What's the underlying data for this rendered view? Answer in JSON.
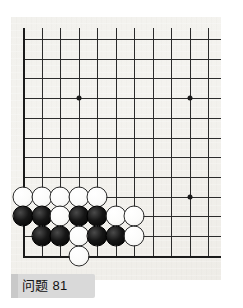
{
  "caption": {
    "label": "问题 81"
  },
  "board": {
    "type": "go-board-diagram",
    "columns": 11,
    "rows": 12,
    "visible_region": "bottom-left corner, right and top edges cropped",
    "colors": {
      "paper": "#f2f1ed",
      "grid_line": "#2b2b2b",
      "edge_line": "#1a1a1a",
      "black_stone": "#000000",
      "white_stone": "#ffffff",
      "caption_tab": "#d9d9d9"
    },
    "star_points": [
      {
        "col": 4,
        "row": 4
      },
      {
        "col": 10,
        "row": 4
      }
    ],
    "marker_stones": [
      {
        "col": 10,
        "row": 9,
        "color": "black-dot"
      }
    ],
    "stones": [
      {
        "col": 1,
        "row": 9,
        "color": "white"
      },
      {
        "col": 2,
        "row": 9,
        "color": "white"
      },
      {
        "col": 3,
        "row": 9,
        "color": "white"
      },
      {
        "col": 4,
        "row": 9,
        "color": "white"
      },
      {
        "col": 5,
        "row": 9,
        "color": "white"
      },
      {
        "col": 1,
        "row": 10,
        "color": "black"
      },
      {
        "col": 2,
        "row": 10,
        "color": "black"
      },
      {
        "col": 3,
        "row": 10,
        "color": "white"
      },
      {
        "col": 4,
        "row": 10,
        "color": "black"
      },
      {
        "col": 5,
        "row": 10,
        "color": "black"
      },
      {
        "col": 6,
        "row": 10,
        "color": "white"
      },
      {
        "col": 7,
        "row": 10,
        "color": "white"
      },
      {
        "col": 2,
        "row": 11,
        "color": "black"
      },
      {
        "col": 3,
        "row": 11,
        "color": "black"
      },
      {
        "col": 4,
        "row": 11,
        "color": "white"
      },
      {
        "col": 5,
        "row": 11,
        "color": "black"
      },
      {
        "col": 6,
        "row": 11,
        "color": "black"
      },
      {
        "col": 7,
        "row": 11,
        "color": "white"
      },
      {
        "col": 4,
        "row": 12,
        "color": "white"
      }
    ]
  },
  "geometry": {
    "origin_x": 23.3,
    "origin_y": 39.0,
    "step_x": 18.5,
    "step_y": 19.7,
    "board_left": 11,
    "board_top": 17,
    "board_width": 210,
    "board_height": 263
  }
}
